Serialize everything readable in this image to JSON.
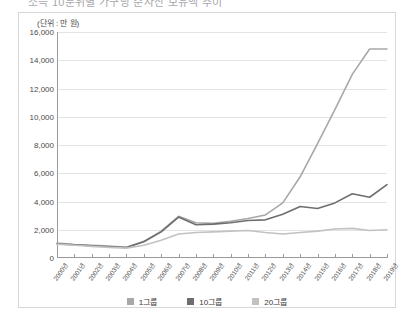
{
  "page": {
    "cut_off_title": "소득 10분위별 가구당 순자산 보유액 추이",
    "unit_label": "(단위 : 만 원)"
  },
  "chart_data": {
    "type": "line",
    "title": "",
    "xlabel": "",
    "ylabel": "",
    "unit": "만 원",
    "ylim": [
      0,
      16000
    ],
    "ytick_step": 2000,
    "grid": true,
    "legend_position": "bottom",
    "ytick_labels": [
      "16,000",
      "14,000",
      "12,000",
      "10,000",
      "8,000",
      "6,000",
      "4,000",
      "2,000",
      "0"
    ],
    "yticks": [
      16000,
      14000,
      12000,
      10000,
      8000,
      6000,
      4000,
      2000,
      0
    ],
    "categories": [
      "2000년",
      "2001년",
      "2002년",
      "2003년",
      "2004년",
      "2005년",
      "2006년",
      "2007년",
      "2008년",
      "2009년",
      "2010년",
      "2011년",
      "2012년",
      "2013년",
      "2014년",
      "2015년",
      "2016년",
      "2017년",
      "2018년",
      "2019년"
    ],
    "series": [
      {
        "name": "1그룹",
        "color": "#a8a8a8",
        "values": [
          1050,
          960,
          900,
          840,
          760,
          1180,
          1900,
          2950,
          2500,
          2450,
          2600,
          2800,
          3050,
          3900,
          5750,
          8100,
          10500,
          13000,
          14800,
          14800
        ]
      },
      {
        "name": "10그룹",
        "color": "#6e6e6e",
        "values": [
          1000,
          940,
          870,
          800,
          740,
          1150,
          1850,
          2900,
          2350,
          2400,
          2500,
          2650,
          2700,
          3100,
          3650,
          3500,
          3900,
          4550,
          4300,
          5200
        ]
      },
      {
        "name": "20그룹",
        "color": "#c2c2c2",
        "values": [
          980,
          900,
          820,
          750,
          700,
          900,
          1250,
          1700,
          1800,
          1850,
          1900,
          1950,
          1800,
          1700,
          1800,
          1900,
          2050,
          2100,
          1950,
          2000
        ]
      }
    ]
  },
  "legend": {
    "items": [
      {
        "label": "1그룹",
        "color": "#a8a8a8"
      },
      {
        "label": "10그룹",
        "color": "#6e6e6e"
      },
      {
        "label": "20그룹",
        "color": "#c2c2c2"
      }
    ]
  }
}
